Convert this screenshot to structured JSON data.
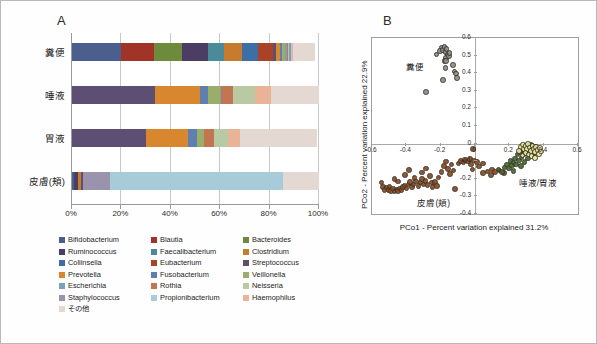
{
  "figure": {
    "panel_a_letter": "A",
    "panel_b_letter": "B"
  },
  "panel_a": {
    "categories": [
      "糞便",
      "唾液",
      "胃液",
      "皮膚(頬)"
    ],
    "x_ticks": [
      "0%",
      "20%",
      "40%",
      "60%",
      "80%",
      "100%"
    ],
    "x_tick_values": [
      0,
      20,
      40,
      60,
      80,
      100
    ],
    "legend": [
      {
        "label": "Bifidobacterium",
        "color": "#4a5f8e"
      },
      {
        "label": "Blautia",
        "color": "#a23327"
      },
      {
        "label": "Bacteroides",
        "color": "#6e8b3d"
      },
      {
        "label": "Ruminococcus",
        "color": "#4b3d63"
      },
      {
        "label": "Faecalibacterium",
        "color": "#4a8a99"
      },
      {
        "label": "Clostridium",
        "color": "#c77b2c"
      },
      {
        "label": "Collinsella",
        "color": "#3d6ea5"
      },
      {
        "label": "Eubacterium",
        "color": "#a8432a"
      },
      {
        "label": "Streptococcus",
        "color": "#5d4e74"
      },
      {
        "label": "Prevotella",
        "color": "#d8872f"
      },
      {
        "label": "Fusobacterium",
        "color": "#5f7fae"
      },
      {
        "label": "Veillonella",
        "color": "#9aad6b"
      },
      {
        "label": "Escherichia",
        "color": "#79a3b1"
      },
      {
        "label": "Rothia",
        "color": "#c1764f"
      },
      {
        "label": "Neisseria",
        "color": "#b9c9a4"
      },
      {
        "label": "Staphylococcus",
        "color": "#9a93ad"
      },
      {
        "label": "Propionibacterium",
        "color": "#a8cbda"
      },
      {
        "label": "Haemophilus",
        "color": "#e9b396"
      },
      {
        "label": "その他",
        "color": "#e4d8d2"
      }
    ]
  },
  "chart_data": [
    {
      "type": "bar",
      "title": "A",
      "orientation": "horizontal",
      "stacked": true,
      "xlabel": "",
      "ylabel": "",
      "xlim": [
        0,
        100
      ],
      "x_unit": "%",
      "categories": [
        "糞便",
        "唾液",
        "胃液",
        "皮膚(頬)"
      ],
      "series": [
        {
          "name": "Bifidobacterium",
          "color": "#4a5f8e",
          "values": [
            20.0,
            0.0,
            0.0,
            0.8
          ]
        },
        {
          "name": "Blautia",
          "color": "#a23327",
          "values": [
            13.0,
            0.0,
            0.0,
            0.0
          ]
        },
        {
          "name": "Bacteroides",
          "color": "#6e8b3d",
          "values": [
            11.5,
            0.0,
            0.0,
            0.0
          ]
        },
        {
          "name": "Ruminococcus",
          "color": "#4b3d63",
          "values": [
            10.5,
            0.0,
            0.0,
            1.5
          ]
        },
        {
          "name": "Faecalibacterium",
          "color": "#4a8a99",
          "values": [
            6.5,
            0.0,
            0.0,
            0.0
          ]
        },
        {
          "name": "Clostridium",
          "color": "#c77b2c",
          "values": [
            7.5,
            0.0,
            0.0,
            1.2
          ]
        },
        {
          "name": "Collinsella",
          "color": "#3d6ea5",
          "values": [
            6.5,
            0.0,
            0.0,
            0.0
          ]
        },
        {
          "name": "Eubacterium",
          "color": "#a8432a",
          "values": [
            6.0,
            0.0,
            0.0,
            0.0
          ]
        },
        {
          "name": "Streptococcus",
          "color": "#5d4e74",
          "values": [
            1.2,
            33.5,
            30.0,
            1.0
          ]
        },
        {
          "name": "Prevotella",
          "color": "#d8872f",
          "values": [
            1.5,
            18.5,
            17.0,
            0.0
          ]
        },
        {
          "name": "Fusobacterium",
          "color": "#5f7fae",
          "values": [
            1.0,
            3.0,
            3.5,
            0.0
          ]
        },
        {
          "name": "Veillonella",
          "color": "#9aad6b",
          "values": [
            1.0,
            5.0,
            3.0,
            0.0
          ]
        },
        {
          "name": "Escherichia",
          "color": "#79a3b1",
          "values": [
            0.8,
            0.5,
            0.0,
            0.0
          ]
        },
        {
          "name": "Rothia",
          "color": "#c1764f",
          "values": [
            0.5,
            4.5,
            4.0,
            0.0
          ]
        },
        {
          "name": "Neisseria",
          "color": "#b9c9a4",
          "values": [
            0.5,
            9.0,
            5.5,
            0.0
          ]
        },
        {
          "name": "Staphylococcus",
          "color": "#9a93ad",
          "values": [
            0.5,
            0.0,
            0.0,
            11.0
          ]
        },
        {
          "name": "Propionibacterium",
          "color": "#a8cbda",
          "values": [
            0.5,
            0.0,
            0.0,
            70.0
          ]
        },
        {
          "name": "Haemophilus",
          "color": "#e9b396",
          "values": [
            0.5,
            6.5,
            5.0,
            0.0
          ]
        },
        {
          "name": "その他",
          "color": "#e4d8d2",
          "values": [
            9.0,
            19.5,
            31.0,
            14.5
          ]
        }
      ]
    },
    {
      "type": "scatter",
      "title": "B",
      "xlabel": "PCo1 - Percent variation explained 31.2%",
      "ylabel": "PCo2 - Percent variation explained 22.9%",
      "xlim": [
        -0.6,
        0.6
      ],
      "ylim": [
        -0.4,
        0.6
      ],
      "x_ticks": [
        "-0.6",
        "-0.4",
        "-0.2",
        "0",
        "0.2",
        "0.4",
        "0.6"
      ],
      "x_tick_values": [
        -0.6,
        -0.4,
        -0.2,
        0,
        0.2,
        0.4,
        0.6
      ],
      "y_ticks": [
        "-0.4",
        "-0.3",
        "-0.2",
        "-0.1",
        "0",
        "0.1",
        "0.2",
        "0.3",
        "0.4",
        "0.5",
        "0.6"
      ],
      "y_tick_values": [
        -0.4,
        -0.3,
        -0.2,
        -0.1,
        0,
        0.1,
        0.2,
        0.3,
        0.4,
        0.5,
        0.6
      ],
      "grid": false,
      "legend_position": "inline-annotations",
      "annotations": [
        {
          "text": "糞便",
          "x": -0.4,
          "y": 0.445
        },
        {
          "text": "皮膚(頬)",
          "x": -0.335,
          "y": -0.325
        },
        {
          "text": "唾液/胃液",
          "x": 0.255,
          "y": -0.215
        }
      ],
      "series": [
        {
          "name": "糞便",
          "color": "#8c8c8c",
          "points": [
            [
              -0.285,
              0.293
            ],
            [
              -0.225,
              0.507
            ],
            [
              -0.205,
              0.527
            ],
            [
              -0.196,
              0.545
            ],
            [
              -0.186,
              0.533
            ],
            [
              -0.178,
              0.548
            ],
            [
              -0.173,
              0.52
            ],
            [
              -0.166,
              0.537
            ],
            [
              -0.16,
              0.505
            ],
            [
              -0.168,
              0.488
            ],
            [
              -0.178,
              0.47
            ],
            [
              -0.152,
              0.498
            ],
            [
              -0.186,
              0.36
            ],
            [
              -0.172,
              0.43
            ],
            [
              -0.168,
              0.468
            ],
            [
              -0.12,
              0.41
            ],
            [
              -0.112,
              0.398
            ],
            [
              -0.106,
              0.372
            ],
            [
              -0.128,
              0.445
            ],
            [
              -0.148,
              0.515
            ]
          ]
        },
        {
          "name": "皮膚(頬)",
          "color": "#8a4a22",
          "points": [
            [
              -0.545,
              -0.222
            ],
            [
              -0.535,
              -0.245
            ],
            [
              -0.528,
              -0.262
            ],
            [
              -0.515,
              -0.25
            ],
            [
              -0.505,
              -0.265
            ],
            [
              -0.498,
              -0.243
            ],
            [
              -0.488,
              -0.268
            ],
            [
              -0.478,
              -0.256
            ],
            [
              -0.468,
              -0.272
            ],
            [
              -0.458,
              -0.26
            ],
            [
              -0.448,
              -0.268
            ],
            [
              -0.438,
              -0.255
            ],
            [
              -0.428,
              -0.262
            ],
            [
              -0.418,
              -0.248
            ],
            [
              -0.47,
              -0.2
            ],
            [
              -0.448,
              -0.215
            ],
            [
              -0.41,
              -0.238
            ],
            [
              -0.398,
              -0.255
            ],
            [
              -0.388,
              -0.232
            ],
            [
              -0.378,
              -0.218
            ],
            [
              -0.368,
              -0.248
            ],
            [
              -0.358,
              -0.232
            ],
            [
              -0.408,
              -0.178
            ],
            [
              -0.385,
              -0.15
            ],
            [
              -0.352,
              -0.196
            ],
            [
              -0.342,
              -0.215
            ],
            [
              -0.33,
              -0.24
            ],
            [
              -0.318,
              -0.222
            ],
            [
              -0.308,
              -0.2
            ],
            [
              -0.3,
              -0.232
            ],
            [
              -0.288,
              -0.212
            ],
            [
              -0.276,
              -0.236
            ],
            [
              -0.308,
              -0.165
            ],
            [
              -0.286,
              -0.142
            ],
            [
              -0.262,
              -0.185
            ],
            [
              -0.252,
              -0.222
            ],
            [
              -0.248,
              -0.248
            ],
            [
              -0.232,
              -0.218
            ],
            [
              -0.222,
              -0.24
            ],
            [
              -0.212,
              -0.192
            ],
            [
              -0.196,
              -0.16
            ],
            [
              -0.182,
              -0.128
            ],
            [
              -0.168,
              -0.102
            ],
            [
              -0.158,
              -0.145
            ],
            [
              -0.146,
              -0.172
            ],
            [
              -0.136,
              -0.118
            ],
            [
              -0.125,
              -0.152
            ],
            [
              -0.115,
              -0.258
            ],
            [
              -0.095,
              -0.112
            ],
            [
              -0.082,
              -0.098
            ],
            [
              -0.068,
              -0.108
            ],
            [
              -0.055,
              -0.092
            ],
            [
              -0.042,
              -0.102
            ],
            [
              -0.03,
              -0.088
            ],
            [
              -0.022,
              -0.118
            ],
            [
              -0.015,
              -0.148
            ],
            [
              -0.012,
              -0.032
            ],
            [
              -0.005,
              -0.095
            ],
            [
              0.012,
              -0.105
            ],
            [
              0.025,
              -0.13
            ],
            [
              0.045,
              -0.112
            ],
            [
              0.072,
              -0.158
            ],
            [
              0.098,
              -0.148
            ],
            [
              0.118,
              -0.16
            ],
            [
              0.142,
              -0.152
            ],
            [
              0.168,
              -0.168
            ],
            [
              0.092,
              -0.178
            ],
            [
              0.048,
              -0.168
            ]
          ]
        },
        {
          "name": "唾液/胃液",
          "color": "#3f6b2e",
          "points": [
            [
              0.138,
              -0.148
            ],
            [
              0.158,
              -0.162
            ],
            [
              0.172,
              -0.135
            ],
            [
              0.186,
              -0.118
            ],
            [
              0.198,
              -0.142
            ],
            [
              0.206,
              -0.098
            ],
            [
              0.215,
              -0.125
            ],
            [
              0.224,
              -0.108
            ],
            [
              0.232,
              -0.085
            ],
            [
              0.24,
              -0.118
            ],
            [
              0.248,
              -0.062
            ],
            [
              0.256,
              -0.095
            ],
            [
              0.262,
              -0.048
            ],
            [
              0.27,
              -0.078
            ],
            [
              0.278,
              -0.032
            ],
            [
              0.286,
              -0.058
            ],
            [
              0.294,
              -0.022
            ],
            [
              0.302,
              -0.045
            ],
            [
              0.31,
              -0.015
            ],
            [
              0.318,
              -0.038
            ],
            [
              0.326,
              -0.008
            ],
            [
              0.334,
              -0.028
            ],
            [
              0.342,
              -0.055
            ],
            [
              0.352,
              -0.018
            ],
            [
              0.308,
              -0.085
            ],
            [
              0.288,
              -0.105
            ],
            [
              0.268,
              -0.128
            ],
            [
              0.225,
              -0.155
            ]
          ]
        },
        {
          "name": "唾液/胃液-light",
          "color": "#e8e79c",
          "points": [
            [
              0.268,
              -0.02
            ],
            [
              0.278,
              -0.005
            ],
            [
              0.286,
              -0.03
            ],
            [
              0.295,
              -0.012
            ],
            [
              0.302,
              -0.032
            ],
            [
              0.31,
              -0.002
            ],
            [
              0.318,
              -0.022
            ],
            [
              0.326,
              -0.042
            ],
            [
              0.334,
              -0.012
            ],
            [
              0.342,
              -0.03
            ],
            [
              0.35,
              -0.048
            ],
            [
              0.356,
              -0.018
            ],
            [
              0.364,
              -0.035
            ],
            [
              0.372,
              -0.058
            ],
            [
              0.378,
              -0.025
            ],
            [
              0.386,
              -0.045
            ],
            [
              0.295,
              -0.052
            ],
            [
              0.312,
              -0.062
            ],
            [
              0.33,
              -0.072
            ],
            [
              0.348,
              -0.082
            ],
            [
              0.258,
              -0.042
            ],
            [
              0.276,
              -0.068
            ]
          ]
        }
      ]
    }
  ]
}
